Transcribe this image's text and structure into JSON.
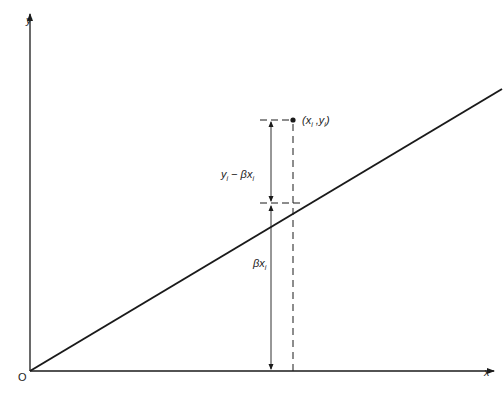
{
  "diagram": {
    "type": "regression-through-origin",
    "axes": {
      "x_label": "x",
      "y_label": "y",
      "origin_label": "O"
    },
    "line": {
      "label": "y = βx",
      "color": "#1a1a1a"
    },
    "point": {
      "label_open": "(x",
      "label_sep": " ,y",
      "label_close": ")",
      "sub": "i"
    },
    "residual_label": {
      "y": "y",
      "minus": " − βx",
      "sub": "i"
    },
    "fitted_label": {
      "beta": "βx",
      "sub": "i"
    },
    "colors": {
      "ink": "#1a1a1a",
      "background": "#ffffff"
    }
  }
}
